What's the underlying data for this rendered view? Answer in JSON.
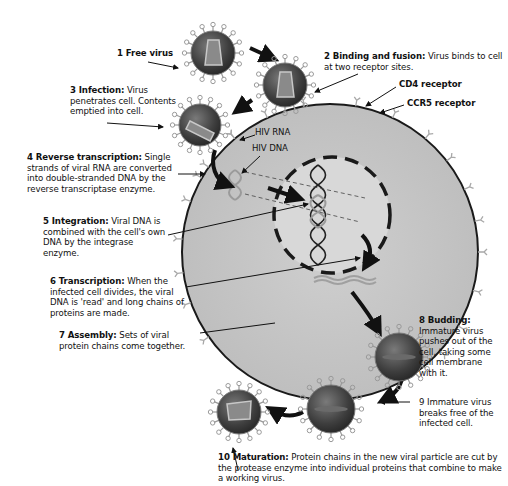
{
  "colors": {
    "cell_fill": "#c4c4c4",
    "cell_outline": "#1a1a1a",
    "nucleus_fill": "#d6d6d6",
    "virus_body": "#4a4a4a",
    "virus_spike": "#9a9a9a",
    "arrow": "#111111",
    "background": "#ffffff"
  },
  "steps": [
    {
      "id": 1,
      "heading": "1 Free virus",
      "text": ""
    },
    {
      "id": 2,
      "heading": "2 Binding and fusion:",
      "text": "Virus binds to cell at two receptor sites."
    },
    {
      "id": 3,
      "heading": "3 Infection:",
      "text": "Virus penetrates cell. Contents emptied into cell."
    },
    {
      "id": 4,
      "heading": "4 Reverse transcription:",
      "text": "Single strands of viral RNA are converted into double-stranded DNA by the reverse transcriptase enzyme."
    },
    {
      "id": 5,
      "heading": "5 Integration:",
      "text": "Viral DNA is combined with the cell's own DNA by the integrase enzyme."
    },
    {
      "id": 6,
      "heading": "6 Transcription:",
      "text": "When the infected cell divides, the viral DNA is 'read' and long chains of proteins are made."
    },
    {
      "id": 7,
      "heading": "7 Assembly:",
      "text": "Sets of viral protein chains come together."
    },
    {
      "id": 8,
      "heading": "8 Budding:",
      "text": "Immature virus pushes out of the cell, taking some cell membrane with it."
    },
    {
      "id": 9,
      "heading": "9",
      "text": "Immature virus breaks free of the infected cell."
    },
    {
      "id": 10,
      "heading": "10 Maturation:",
      "text": "Protein chains in the new viral particle are cut by the protease enzyme into individual proteins that combine to make a working virus."
    }
  ],
  "labels": {
    "cd4": "CD4 receptor",
    "ccr5": "CCR5 receptor",
    "hiv_rna": "HIV RNA",
    "hiv_dna": "HIV DNA"
  }
}
